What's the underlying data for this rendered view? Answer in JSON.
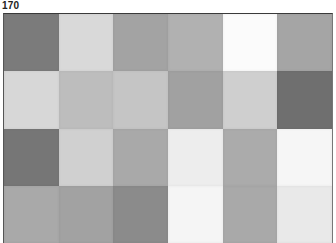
{
  "label": "170",
  "grid": {
    "columns": 6,
    "rows": 4,
    "patches": [
      [
        "#7b7b7b",
        "#d9d9d9",
        "#a3a3a3",
        "#b1b1b1",
        "#fbfbfb",
        "#a5a5a5"
      ],
      [
        "#d7d7d7",
        "#bdbdbd",
        "#c5c5c5",
        "#a1a1a1",
        "#cfcfcf",
        "#6f6f6f"
      ],
      [
        "#767676",
        "#d0d0d0",
        "#a9a9a9",
        "#ededed",
        "#ababab",
        "#f6f6f6"
      ],
      [
        "#a9a9a9",
        "#a2a2a2",
        "#8b8b8b",
        "#f5f5f5",
        "#a9a9a9",
        "#e9e9e9"
      ]
    ]
  }
}
